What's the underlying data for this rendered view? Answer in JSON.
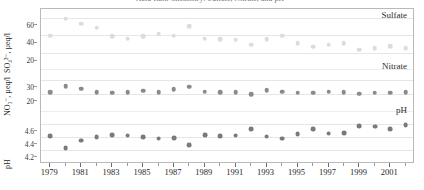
{
  "figure": {
    "title_clipped": "Acid Rain Chemistry: Sulfate, Nitrate, and pH",
    "background_color": "#ffffff",
    "frame_color": "#b9b9b9",
    "grid_color": "#e6e6e6"
  },
  "labels": {
    "sulfate": "Sulfate",
    "nitrate": "Nitrate",
    "ph": "pH"
  },
  "axis_titles": {
    "sulfate": "SO₄²⁻, µeq/l",
    "nitrate": "NO₃⁻, µeq/l",
    "ph": "pH"
  },
  "chart_data": {
    "type": "scatter",
    "title": "Acid Rain Chemistry: Sulfate, Nitrate, and pH",
    "xlabel": "",
    "grid": true,
    "legend_position": "inline-right",
    "x": [
      1979,
      1980,
      1981,
      1982,
      1983,
      1984,
      1985,
      1986,
      1987,
      1988,
      1989,
      1990,
      1991,
      1992,
      1993,
      1994,
      1995,
      1996,
      1997,
      1998,
      1999,
      2000,
      2001,
      2002
    ],
    "xlim": [
      1978.4,
      2002.6
    ],
    "xticks_major": [
      1979,
      1981,
      1983,
      1985,
      1987,
      1989,
      1991,
      1993,
      1995,
      1997,
      1999,
      2001
    ],
    "panels": [
      {
        "name": "Sulfate",
        "series_name": "Sulfate",
        "ylabel": "SO₄²⁻, µeq/l",
        "yticks": [
          20,
          40,
          60
        ],
        "ylim": [
          14,
          66
        ],
        "color": "#dcdcdc",
        "values": [
          39.5,
          58.5,
          53.0,
          48.5,
          39.0,
          36.5,
          39.0,
          42.0,
          39.5,
          50.5,
          36.5,
          35.5,
          35.0,
          29.5,
          35.5,
          39.5,
          31.0,
          27.5,
          29.5,
          31.5,
          24.0,
          25.5,
          28.0,
          25.5
        ]
      },
      {
        "name": "Nitrate",
        "series_name": "Nitrate",
        "ylabel": "NO₃⁻, µeq/l",
        "yticks": [
          20,
          30
        ],
        "ylim": [
          14,
          34
        ],
        "color": "#8a8a8a",
        "values": [
          21.0,
          25.5,
          23.5,
          21.0,
          20.5,
          21.0,
          22.0,
          21.0,
          23.0,
          25.0,
          21.5,
          21.0,
          21.0,
          19.5,
          22.5,
          21.5,
          20.5,
          20.5,
          21.5,
          21.0,
          20.0,
          20.5,
          20.5,
          21.0
        ]
      },
      {
        "name": "pH",
        "series_name": "pH",
        "ylabel": "pH",
        "yticks": [
          4.2,
          4.4,
          4.6
        ],
        "ylim": [
          4.12,
          4.7
        ],
        "color": "#7a7a7a",
        "values": [
          4.41,
          4.22,
          4.34,
          4.39,
          4.43,
          4.42,
          4.39,
          4.37,
          4.38,
          4.27,
          4.43,
          4.41,
          4.42,
          4.52,
          4.4,
          4.37,
          4.44,
          4.52,
          4.45,
          4.46,
          4.57,
          4.56,
          4.52,
          4.58
        ]
      }
    ]
  }
}
